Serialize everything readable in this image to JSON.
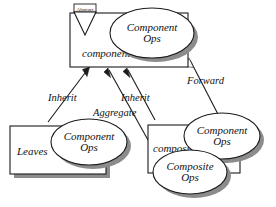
{
  "diagram": {
    "background_color": "#ffffff",
    "stroke_color": "#1b1b1b",
    "shadow_color": "#8c8c8c",
    "fill_color": "#ffffff",
    "nodes": {
      "abstract_marker": {
        "label": "Abstract",
        "shape": "triangle-down"
      },
      "component_box": {
        "label": "component",
        "shape": "rectangle"
      },
      "component_ops_top": {
        "label_line1": "Component",
        "label_line2": "Ops",
        "shape": "ellipse"
      },
      "leaves_box": {
        "label": "Leaves",
        "shape": "rectangle"
      },
      "component_ops_leaves": {
        "label_line1": "Component",
        "label_line2": "Ops",
        "shape": "ellipse"
      },
      "composite_box": {
        "label": "composite",
        "shape": "rectangle"
      },
      "component_ops_composite": {
        "label_line1": "Component",
        "label_line2": "Ops",
        "shape": "ellipse"
      },
      "composite_ops": {
        "label_line1": "Composite",
        "label_line2": "Ops",
        "shape": "ellipse"
      }
    },
    "edges": [
      {
        "id": "inherit-left",
        "label": "Inherit",
        "from": "leaves_box",
        "to": "component_box",
        "arrow": "solid-head"
      },
      {
        "id": "aggregate",
        "label": "Aggregate",
        "from": "composite_box",
        "to": "component_box",
        "arrow": "solid-head"
      },
      {
        "id": "inherit-right",
        "label": "Inherit",
        "from": "composite_box",
        "to": "component_box",
        "arrow": "solid-head"
      },
      {
        "id": "forward",
        "label": "Forward",
        "from": "composite_ops",
        "to": "component_ops_top",
        "arrow": "solid-head"
      }
    ]
  }
}
